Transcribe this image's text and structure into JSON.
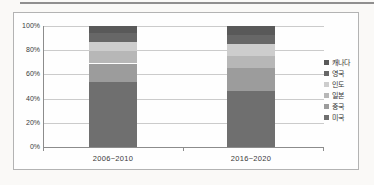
{
  "chart_data": {
    "type": "bar",
    "variant": "100%-stacked-column",
    "title": "",
    "xlabel": "",
    "ylabel": "",
    "categories": [
      "2006~2010",
      "2016~2020"
    ],
    "series": [
      {
        "name": "미국",
        "color": "#6f6f6f",
        "values": [
          54,
          46
        ]
      },
      {
        "name": "중국",
        "color": "#9c9c9c",
        "values": [
          15,
          19
        ]
      },
      {
        "name": "일본",
        "color": "#b7b7b7",
        "values": [
          10,
          10
        ]
      },
      {
        "name": "인도",
        "color": "#cdcdcd",
        "values": [
          8,
          10
        ]
      },
      {
        "name": "영국",
        "color": "#676767",
        "values": [
          7,
          8
        ]
      },
      {
        "name": "캐나다",
        "color": "#595959",
        "values": [
          6,
          7
        ]
      }
    ],
    "legend_order": [
      "캐나다",
      "영국",
      "인도",
      "일본",
      "중국",
      "미국"
    ],
    "legend_position": "right",
    "y_ticks": [
      "100%",
      "80%",
      "60%",
      "40%",
      "20%",
      "0%"
    ],
    "ylim": [
      0,
      100
    ],
    "grid": true
  }
}
